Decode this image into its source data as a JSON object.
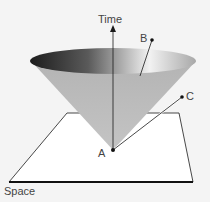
{
  "diagram": {
    "axis_time_label": "Time",
    "axis_space_label": "Space",
    "points": [
      {
        "id": "A",
        "label": "A"
      },
      {
        "id": "B",
        "label": "B"
      },
      {
        "id": "C",
        "label": "C"
      }
    ],
    "colors": {
      "background": "#f4f4f4",
      "line": "#1a1a1a",
      "cone_light": "#bdbdbd",
      "cone_dark": "#1e1e1e",
      "text": "#444444"
    }
  }
}
